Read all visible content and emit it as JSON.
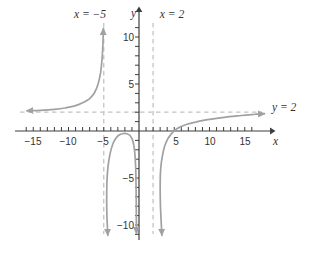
{
  "figure": {
    "background": "#ffffff"
  },
  "chart_data": {
    "type": "line",
    "xlabel": "x",
    "ylabel": "y",
    "xlim": [
      -16.5,
      18.5
    ],
    "ylim": [
      -11.5,
      11.5
    ],
    "grid": false,
    "minor_tick_step": 1,
    "x_minor_range": [
      -16,
      16
    ],
    "y_minor_range": [
      -11,
      11
    ],
    "x_ticks_labeled": [
      -15,
      -10,
      -5,
      5,
      10,
      15
    ],
    "x_tick_labels": [
      "−15",
      "−10",
      "−5",
      "5",
      "10",
      "15"
    ],
    "y_ticks_labeled": [
      10,
      5,
      -5,
      -10
    ],
    "y_tick_labels": [
      "10",
      "5",
      "−5",
      "−10"
    ],
    "asymptotes": {
      "vertical": [
        {
          "x": -5,
          "label": "x = −5"
        },
        {
          "x": 2,
          "label": "x = 2"
        }
      ],
      "horizontal": [
        {
          "y": 2,
          "label": "y = 2"
        }
      ]
    },
    "series": [
      {
        "name": "left-branch",
        "points": [
          [
            -15.9,
            2.15
          ],
          [
            -14,
            2.2
          ],
          [
            -12,
            2.3
          ],
          [
            -10.5,
            2.45
          ],
          [
            -9,
            2.7
          ],
          [
            -8,
            3.0
          ],
          [
            -7,
            3.45
          ],
          [
            -6.3,
            4.1
          ],
          [
            -5.8,
            5.0
          ],
          [
            -5.45,
            6.2
          ],
          [
            -5.25,
            7.6
          ],
          [
            -5.12,
            9.2
          ],
          [
            -5.05,
            10.9
          ]
        ]
      },
      {
        "name": "middle-branch",
        "points": [
          [
            -4.42,
            -11.1
          ],
          [
            -4.52,
            -9.5
          ],
          [
            -4.58,
            -7.5
          ],
          [
            -4.55,
            -5.5
          ],
          [
            -4.4,
            -3.8
          ],
          [
            -4.1,
            -2.4
          ],
          [
            -3.7,
            -1.35
          ],
          [
            -3.2,
            -0.7
          ],
          [
            -2.7,
            -0.38
          ],
          [
            -2.2,
            -0.27
          ],
          [
            -1.7,
            -0.3
          ],
          [
            -1.25,
            -0.5
          ],
          [
            -0.92,
            -0.95
          ],
          [
            -0.68,
            -1.8
          ],
          [
            -0.52,
            -3.1
          ],
          [
            -0.44,
            -4.8
          ],
          [
            -0.4,
            -7.0
          ],
          [
            -0.38,
            -9.0
          ],
          [
            -0.36,
            -10.9
          ]
        ]
      },
      {
        "name": "right-branch",
        "points": [
          [
            3.25,
            -11.1
          ],
          [
            3.12,
            -9.3
          ],
          [
            3.02,
            -7.3
          ],
          [
            3.0,
            -5.5
          ],
          [
            3.08,
            -4.0
          ],
          [
            3.3,
            -2.7
          ],
          [
            3.65,
            -1.6
          ],
          [
            4.1,
            -0.82
          ],
          [
            4.6,
            -0.3
          ],
          [
            5.1,
            0.1
          ],
          [
            5.8,
            0.42
          ],
          [
            6.8,
            0.72
          ],
          [
            8,
            0.95
          ],
          [
            9.5,
            1.18
          ],
          [
            11,
            1.35
          ],
          [
            12.8,
            1.52
          ],
          [
            14.5,
            1.65
          ],
          [
            16.2,
            1.76
          ],
          [
            17.8,
            1.84
          ]
        ]
      }
    ],
    "colors": {
      "curve": "#a1a1a1",
      "asymptote": "#c3c3c3",
      "axis": "#3e3e3e",
      "text": "#333333"
    }
  }
}
